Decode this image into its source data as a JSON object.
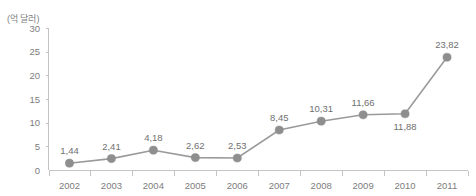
{
  "title_fragment": "",
  "unit_label": "(억 달러)",
  "chart_data": {
    "type": "line",
    "title": "",
    "xlabel": "",
    "ylabel": "(억 달러)",
    "ylim": [
      0,
      30
    ],
    "yticks": [
      0,
      5,
      10,
      15,
      20,
      25,
      30
    ],
    "ytick_labels": [
      "0",
      "5",
      "10",
      "15",
      "20",
      "25",
      "30"
    ],
    "grid": false,
    "legend": false,
    "categories": [
      "2002",
      "2003",
      "2004",
      "2005",
      "2006",
      "2007",
      "2008",
      "2009",
      "2010",
      "2011"
    ],
    "values": [
      1.44,
      2.41,
      4.18,
      2.62,
      2.53,
      8.45,
      10.31,
      11.66,
      11.88,
      23.82
    ],
    "point_labels": [
      "1,44",
      "2,41",
      "4,18",
      "2,62",
      "2,53",
      "8,45",
      "10,31",
      "11,66",
      "11,88",
      "23,82"
    ],
    "point_label_positions": [
      "above",
      "above",
      "above",
      "above",
      "above",
      "above",
      "above",
      "above",
      "below",
      "above"
    ],
    "line_color": "#9a9a9a",
    "marker_color": "#8e8e8e",
    "axis_color": "#c4c4c4",
    "text_color": "#7a7a7a"
  }
}
